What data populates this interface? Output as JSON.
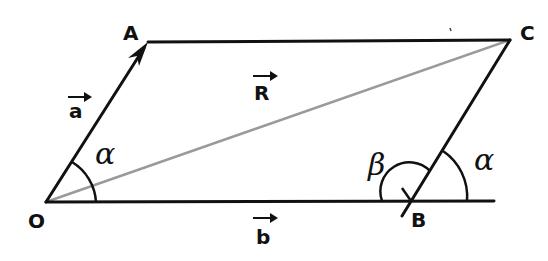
{
  "diagram": {
    "points": {
      "O": {
        "label": "O",
        "x": 46,
        "y": 202
      },
      "A": {
        "label": "A",
        "x": 148,
        "y": 42
      },
      "C": {
        "label": "C",
        "x": 510,
        "y": 40
      },
      "B": {
        "label": "B",
        "x": 411,
        "y": 201
      }
    },
    "vectors": {
      "a": {
        "label": "a",
        "from": "O",
        "to": "A"
      },
      "b": {
        "label": "b",
        "from": "O",
        "to": "B"
      },
      "R": {
        "label": "R",
        "from": "O",
        "to": "C",
        "color": "#9a9a9a"
      }
    },
    "angles": {
      "alpha_at_O": {
        "label": "α"
      },
      "beta_at_B": {
        "label": "β"
      },
      "alpha_at_B": {
        "label": "α"
      }
    },
    "colors": {
      "stroke": "#111111",
      "resultant": "#9a9a9a",
      "background": "#ffffff"
    }
  }
}
